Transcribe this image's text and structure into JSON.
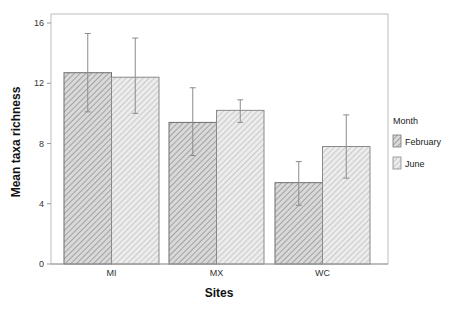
{
  "chart_data": {
    "type": "bar",
    "title": "",
    "xlabel": "Sites",
    "ylabel": "Mean taxa richness",
    "ylim": [
      0,
      16
    ],
    "yticks": [
      0,
      4,
      8,
      12,
      16
    ],
    "grid": false,
    "legend_position": "right",
    "legend_title": "Month",
    "categories": [
      "MI",
      "MX",
      "WC"
    ],
    "series": [
      {
        "name": "February",
        "values": [
          12.7,
          9.4,
          5.4
        ],
        "error_upper": [
          15.3,
          11.7,
          6.8
        ],
        "error_lower": [
          10.1,
          7.2,
          3.9
        ],
        "fill": "#d9d9d9",
        "hatch_color": "#8a8a8a"
      },
      {
        "name": "June",
        "values": [
          12.4,
          10.2,
          7.8
        ],
        "error_upper": [
          15.0,
          10.9,
          9.9
        ],
        "error_lower": [
          10.0,
          9.4,
          5.7
        ],
        "fill": "#e9e9e9",
        "hatch_color": "#a5a5a5"
      }
    ]
  }
}
